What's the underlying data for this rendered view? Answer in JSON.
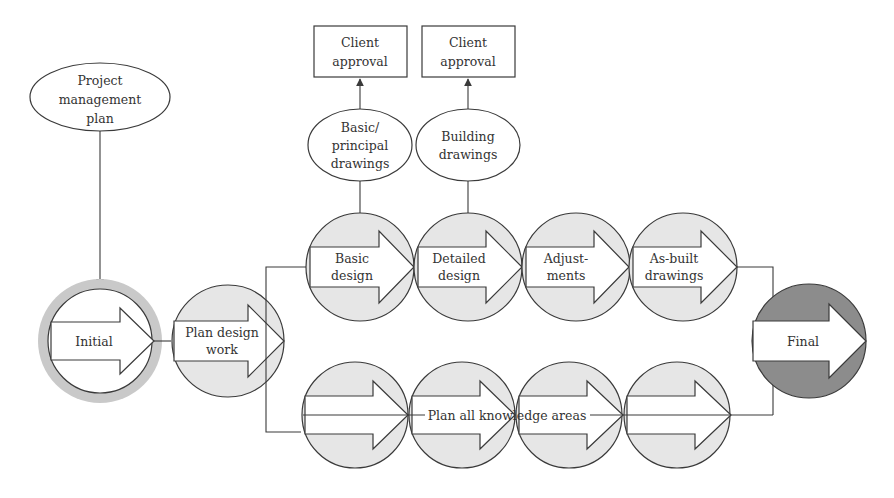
{
  "colors": {
    "stroke": "#3a3a3a",
    "circle_fill": "#e6e6e6",
    "initial_ring": "#c9c9c9",
    "final_fill": "#8c8c8c",
    "arrow_fill": "#ffffff",
    "text": "#333333"
  },
  "diagram": {
    "project_management_plan": {
      "lines": [
        "Project",
        "management",
        "plan"
      ]
    },
    "initial": {
      "label": "Initial"
    },
    "plan_design_work": {
      "lines": [
        "Plan design",
        "work"
      ]
    },
    "top_row": [
      {
        "lines": [
          "Basic",
          "design"
        ]
      },
      {
        "lines": [
          "Detailed",
          "design"
        ]
      },
      {
        "lines": [
          "Adjust-",
          "ments"
        ]
      },
      {
        "lines": [
          "As-built",
          "drawings"
        ]
      }
    ],
    "deliverables": [
      {
        "lines": [
          "Basic/",
          "principal",
          "drawings"
        ]
      },
      {
        "lines": [
          "Building",
          "drawings"
        ]
      }
    ],
    "approvals": [
      {
        "lines": [
          "Client",
          "approval"
        ]
      },
      {
        "lines": [
          "Client",
          "approval"
        ]
      }
    ],
    "bottom_row": {
      "label": "Plan all knowledge areas",
      "count": 4
    },
    "final": {
      "label": "Final"
    }
  }
}
